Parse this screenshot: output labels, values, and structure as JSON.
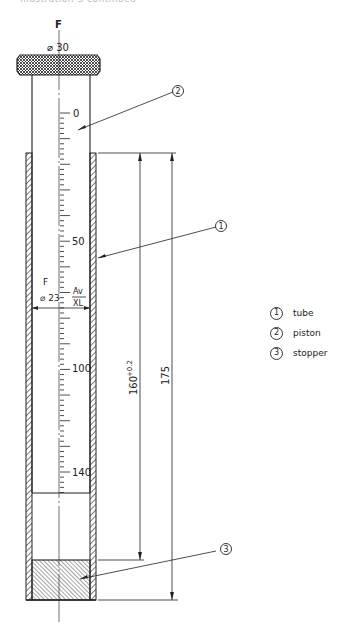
{
  "header_fragment": "Illustration 3 continued",
  "drawing": {
    "force_top_label": "F",
    "cap_diameter_label": "⌀ 30",
    "scale_labels": [
      "0",
      "50",
      "100",
      "140"
    ],
    "force_mid_label": "F",
    "bore_diameter_label": "⌀ 23",
    "fit_upper": "Av",
    "fit_lower": "XL",
    "dim_160": "160",
    "dim_160_tol": "+0.2",
    "dim_175": "175",
    "callouts": [
      "1",
      "2",
      "3"
    ]
  },
  "legend": [
    {
      "num": "1",
      "label": "tube"
    },
    {
      "num": "2",
      "label": "piston"
    },
    {
      "num": "3",
      "label": "stopper"
    }
  ],
  "colors": {
    "ink": "#222222",
    "background": "#ffffff"
  }
}
